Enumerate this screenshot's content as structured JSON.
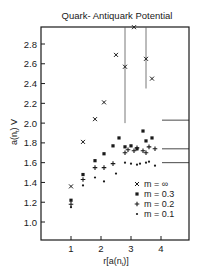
{
  "chart_data": {
    "type": "scatter",
    "title": "Quark- Antiquark Potential",
    "xlabel": "r[a(n_t)]",
    "ylabel": "a(n_t) V",
    "xlim": [
      0,
      5
    ],
    "ylim": [
      0.8,
      3.0
    ],
    "xticks": [
      1,
      2,
      3,
      4
    ],
    "xtick_labels": [
      "1",
      "2",
      "3",
      "4"
    ],
    "yticks": [
      1.0,
      1.2,
      1.4,
      1.6,
      1.8,
      2.0,
      2.2,
      2.4,
      2.6,
      2.8
    ],
    "ytick_labels": [
      "1.0",
      "1.2",
      "1.4",
      "1.6",
      "1.8",
      "2.0",
      "2.2",
      "2.4",
      "2.6",
      "2.8"
    ],
    "grid": false,
    "legend_position": "lower right inside",
    "series": [
      {
        "name": "m = ∞",
        "marker": "x",
        "points": [
          {
            "x": 1.0,
            "y": 1.36
          },
          {
            "x": 1.4,
            "y": 1.81
          },
          {
            "x": 1.8,
            "y": 2.04
          },
          {
            "x": 2.1,
            "y": 2.21
          },
          {
            "x": 2.5,
            "y": 2.69
          },
          {
            "x": 2.8,
            "y": 2.57,
            "err_low": 2.0,
            "err_high": 3.0
          },
          {
            "x": 3.1,
            "y": 2.97
          },
          {
            "x": 3.5,
            "y": 2.65,
            "err_low": 2.35,
            "err_high": 3.0
          },
          {
            "x": 3.7,
            "y": 2.45
          }
        ]
      },
      {
        "name": "m = 0.3",
        "marker": "square",
        "points": [
          {
            "x": 1.0,
            "y": 1.22
          },
          {
            "x": 1.4,
            "y": 1.48
          },
          {
            "x": 1.8,
            "y": 1.62
          },
          {
            "x": 2.1,
            "y": 1.69
          },
          {
            "x": 2.4,
            "y": 1.77
          },
          {
            "x": 2.6,
            "y": 1.85
          },
          {
            "x": 2.8,
            "y": 1.76
          },
          {
            "x": 3.0,
            "y": 1.77
          },
          {
            "x": 3.2,
            "y": 1.74
          },
          {
            "x": 3.4,
            "y": 1.92
          },
          {
            "x": 3.5,
            "y": 1.82
          },
          {
            "x": 3.7,
            "y": 1.85
          }
        ]
      },
      {
        "name": "m = 0.2",
        "marker": "plus",
        "points": [
          {
            "x": 1.0,
            "y": 1.18
          },
          {
            "x": 1.4,
            "y": 1.43
          },
          {
            "x": 1.8,
            "y": 1.55
          },
          {
            "x": 2.1,
            "y": 1.55
          },
          {
            "x": 2.4,
            "y": 1.59
          },
          {
            "x": 2.8,
            "y": 1.7
          },
          {
            "x": 2.9,
            "y": 1.73
          },
          {
            "x": 3.1,
            "y": 1.72
          },
          {
            "x": 3.2,
            "y": 1.75
          },
          {
            "x": 3.4,
            "y": 1.72
          },
          {
            "x": 3.5,
            "y": 1.7
          },
          {
            "x": 3.6,
            "y": 1.76
          },
          {
            "x": 3.8,
            "y": 1.74
          }
        ]
      },
      {
        "name": "m = 0.1",
        "marker": "dot",
        "points": [
          {
            "x": 1.0,
            "y": 1.15
          },
          {
            "x": 1.4,
            "y": 1.37
          },
          {
            "x": 1.8,
            "y": 1.45
          },
          {
            "x": 2.1,
            "y": 1.41
          },
          {
            "x": 2.5,
            "y": 1.49
          },
          {
            "x": 2.8,
            "y": 1.6
          },
          {
            "x": 3.0,
            "y": 1.59
          },
          {
            "x": 3.2,
            "y": 1.58
          },
          {
            "x": 3.3,
            "y": 1.59
          },
          {
            "x": 3.5,
            "y": 1.6
          },
          {
            "x": 3.6,
            "y": 1.61
          },
          {
            "x": 3.8,
            "y": 1.57
          }
        ]
      }
    ],
    "reference_lines": [
      {
        "y": 2.03,
        "from_x": 4.3,
        "to_x": 5.0,
        "label": "m = ∞ asymptote"
      },
      {
        "y": 1.74,
        "from_x": 4.3,
        "to_x": 5.0,
        "label": "m = 0.3/0.2 asymptote"
      },
      {
        "y": 1.6,
        "from_x": 4.3,
        "to_x": 5.0,
        "label": "m = 0.1 asymptote"
      }
    ]
  },
  "legend": {
    "items": [
      {
        "symbol": "×",
        "label": "m =  ∞"
      },
      {
        "symbol": "▪",
        "label": "m = 0.3"
      },
      {
        "symbol": "+",
        "label": "m = 0.2"
      },
      {
        "symbol": "•",
        "label": "m = 0.1"
      }
    ]
  },
  "labels": {
    "title": "Quark- Antiquark Potential",
    "xlabel_main": "r[a(n",
    "xlabel_sub": "t",
    "xlabel_end": ")]",
    "ylabel_main": "a(n",
    "ylabel_sub": "t",
    "ylabel_end": ") V"
  },
  "colors": {
    "ink": "#1a1a1a",
    "background": "#ffffff",
    "errorbar": "#555555"
  }
}
